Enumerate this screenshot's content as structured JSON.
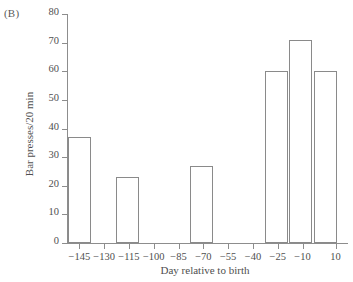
{
  "figure": {
    "panel_label": "(B)"
  },
  "chart_data": {
    "type": "bar",
    "title": "",
    "subtitle": "",
    "xlabel": "Day relative to birth",
    "ylabel": "Bar presses/20 min",
    "ylim": [
      0,
      80
    ],
    "yticks": [
      0,
      10,
      20,
      30,
      40,
      50,
      60,
      70,
      80
    ],
    "ytick_labels": [
      "0",
      "10",
      "20",
      "30",
      "40",
      "50",
      "60",
      "70",
      "80"
    ],
    "xlim": [
      -152.5,
      17.5
    ],
    "xticks": [
      -145,
      -130,
      -115,
      -100,
      -85,
      -70,
      -55,
      -40,
      -25,
      -10,
      10
    ],
    "xtick_labels": [
      "−145",
      "−130",
      "−115",
      "−100",
      "−85",
      "−70",
      "−55",
      "−40",
      "−25",
      "−10",
      "10"
    ],
    "grid": false,
    "legend": null,
    "categories": [
      "−145",
      "−115",
      "−70",
      "−25",
      "−10",
      "10"
    ],
    "values": [
      37,
      23,
      27,
      60,
      71,
      60
    ],
    "bars": [
      {
        "label": "−145",
        "x_center": -145,
        "x_start": -152,
        "x_end": -138,
        "value": 37
      },
      {
        "label": "−115",
        "x_center": -116,
        "x_start": -123,
        "x_end": -109,
        "value": 23
      },
      {
        "label": "−70",
        "x_center": -71,
        "x_start": -78,
        "x_end": -64,
        "value": 27
      },
      {
        "label": "−25",
        "x_center": -26,
        "x_start": -33,
        "x_end": -19,
        "value": 60
      },
      {
        "label": "−10",
        "x_center": -11,
        "x_start": -18,
        "x_end": -4,
        "value": 71
      },
      {
        "label": "10",
        "x_center": 4,
        "x_start": -3,
        "x_end": 11,
        "value": 60
      }
    ],
    "colors": {
      "bar_fill": "#ffffff",
      "bar_edge": "#8a8a8a",
      "axis": "#8d8d8d",
      "text": "#4f4f4f",
      "background": "#ffffff"
    }
  }
}
